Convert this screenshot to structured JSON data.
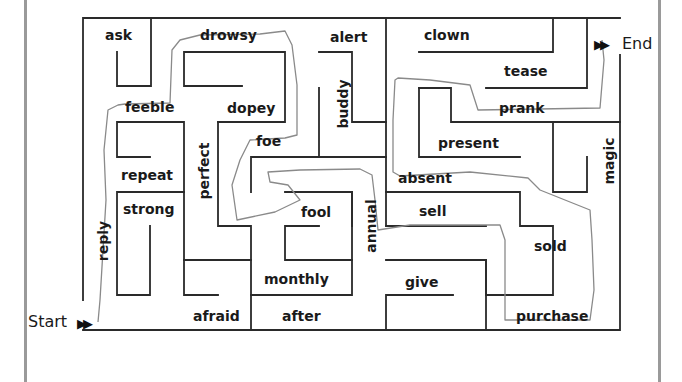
{
  "worksheet": {
    "type": "word maze",
    "start_label": "Start",
    "end_label": "End",
    "arrow_glyph": "▶▶",
    "colors": {
      "walls": "#2a2a2a",
      "pencil_path": "#8a8a8a",
      "page_border": "#9a9a9a",
      "text": "#1a1a1a"
    }
  },
  "words": {
    "ask": "ask",
    "drowsy": "drowsy",
    "alert": "alert",
    "clown": "clown",
    "tease": "tease",
    "feeble": "feeble",
    "dopey": "dopey",
    "buddy": "buddy",
    "prank": "prank",
    "foe": "foe",
    "present": "present",
    "magic": "magic",
    "repeat": "repeat",
    "perfect": "perfect",
    "absent": "absent",
    "strong": "strong",
    "fool": "fool",
    "annual": "annual",
    "sell": "sell",
    "reply": "reply",
    "sold": "sold",
    "monthly": "monthly",
    "give": "give",
    "afraid": "afraid",
    "after": "after",
    "purchase": "purchase"
  },
  "solution_path_words": [
    "reply",
    "feeble",
    "drowsy",
    "foe",
    "fool",
    "annual",
    "sold",
    "purchase",
    "absent",
    "prank"
  ]
}
